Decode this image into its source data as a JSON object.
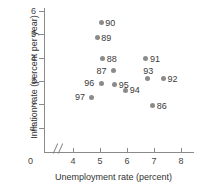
{
  "chart_data": {
    "type": "scatter",
    "title": "",
    "xlabel": "Unemployment rate (percent)",
    "ylabel": "Inflation rate (percent per year)",
    "xlim": [
      3.5,
      8.6
    ],
    "ylim": [
      0,
      6.4
    ],
    "xticks": [
      4,
      5,
      6,
      7,
      8
    ],
    "yticks": [
      1,
      2,
      3,
      4,
      5,
      6
    ],
    "xtick_labels": [
      "4",
      "5",
      "6",
      "7",
      "8"
    ],
    "ytick_labels": [
      "1",
      "2",
      "3",
      "4",
      "5",
      "6"
    ],
    "origin_label": "0",
    "grid": false,
    "legend": "none",
    "axis_break_x": true,
    "point_color": "#8b8b8b",
    "axis_color": "#8a8a8a",
    "points": [
      {
        "label": "90",
        "x": 5.05,
        "y": 5.5,
        "label_side": "right"
      },
      {
        "label": "89",
        "x": 4.9,
        "y": 4.85,
        "label_side": "right"
      },
      {
        "label": "88",
        "x": 5.1,
        "y": 3.95,
        "label_side": "right"
      },
      {
        "label": "87",
        "x": 5.5,
        "y": 3.45,
        "label_side": "left"
      },
      {
        "label": "91",
        "x": 6.7,
        "y": 3.95,
        "label_side": "right"
      },
      {
        "label": "93",
        "x": 6.75,
        "y": 3.1,
        "label_side": "above"
      },
      {
        "label": "92",
        "x": 7.35,
        "y": 3.1,
        "label_side": "right"
      },
      {
        "label": "96",
        "x": 5.05,
        "y": 2.9,
        "label_side": "left"
      },
      {
        "label": "95",
        "x": 5.55,
        "y": 2.85,
        "label_side": "right"
      },
      {
        "label": "94",
        "x": 5.95,
        "y": 2.6,
        "label_side": "right"
      },
      {
        "label": "97",
        "x": 4.7,
        "y": 2.3,
        "label_side": "left"
      },
      {
        "label": "86",
        "x": 6.95,
        "y": 1.95,
        "label_side": "right"
      }
    ]
  }
}
